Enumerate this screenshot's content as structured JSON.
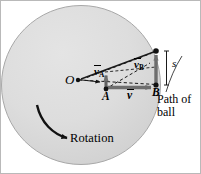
{
  "figure": {
    "type": "physics-diagram",
    "colors": {
      "disk_fill": "#dcdcdc",
      "disk_edge": "#9a9a9a",
      "ink": "#000000",
      "arrow_gray": "#6e6e6e",
      "background": "#ffffff",
      "frame": "#b9b9b9"
    },
    "disk": {
      "label": "Rotation",
      "center_x": 80,
      "center_y": 84,
      "radius": 80
    },
    "points": [
      {
        "id": "O",
        "label": "O",
        "x": 76,
        "y": 79
      },
      {
        "id": "A",
        "label": "A",
        "x": 105,
        "y": 88
      },
      {
        "id": "B",
        "label": "B",
        "x": 155,
        "y": 83
      },
      {
        "id": "T",
        "label": "",
        "x": 155,
        "y": 50
      }
    ],
    "vectors": [
      {
        "id": "vA",
        "symbol": "v",
        "subscript": "A",
        "overbar": true
      },
      {
        "id": "vB",
        "symbol": "v",
        "subscript": "B",
        "overbar": true
      },
      {
        "id": "v",
        "symbol": "v",
        "subscript": "",
        "overbar": true
      }
    ],
    "annotations": {
      "deflection": "s",
      "path_line1": "Path of",
      "path_line2": "ball",
      "path_full": "Path of ball"
    }
  }
}
